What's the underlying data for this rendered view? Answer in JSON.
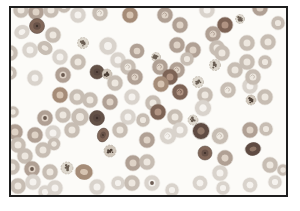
{
  "figure": {
    "kind": "peripheral-blood-smear-micrograph",
    "page_background": "#ffffff",
    "field_background": "#fcfbf8",
    "frame": {
      "x": 10,
      "y": 7,
      "width": 277,
      "height": 189,
      "border_color": "#1e1e1e",
      "border_width": 2
    }
  },
  "palette": {
    "shades": {
      "pale": {
        "ring": "#d9d3cc",
        "center": "#f5f2ee"
      },
      "light": {
        "ring": "#c7bdb3",
        "center": "#ede7df"
      },
      "med": {
        "ring": "#b0a094",
        "center": "#ded2c6"
      },
      "tan": {
        "ring": "#a58c78",
        "center": "#d6c3b1"
      },
      "dark": {
        "ring": "#7d6355",
        "center": "#b09382"
      },
      "vdark": {
        "ring": "#5e4c43",
        "center": "#907767"
      }
    },
    "platelet": {
      "base": "#ddd7cd",
      "dot": "#6b5e53",
      "dark_base": "#cfc5b9",
      "dark_dot": "#4e4037",
      "edge": "#aca296"
    },
    "core": "#4f3f37",
    "core_dot": "#3d302a"
  },
  "cells": [
    {
      "x": 21,
      "y": 10,
      "r": 8,
      "s": "light"
    },
    {
      "x": 36,
      "y": 12,
      "r": 8,
      "s": "med"
    },
    {
      "x": 51,
      "y": 10,
      "r": 8,
      "s": "light"
    },
    {
      "x": 64,
      "y": 6,
      "r": 7,
      "s": "light"
    },
    {
      "x": 78,
      "y": 15,
      "r": 8,
      "s": "pale"
    },
    {
      "x": 100,
      "y": 13,
      "r": 8,
      "s": "light",
      "m": 1
    },
    {
      "x": 130,
      "y": 15,
      "r": 8,
      "s": "tan"
    },
    {
      "x": 165,
      "y": 15,
      "r": 8,
      "s": "med",
      "m": 1
    },
    {
      "x": 180,
      "y": 25,
      "r": 8,
      "s": "med"
    },
    {
      "x": 207,
      "y": 10,
      "r": 8,
      "s": "pale"
    },
    {
      "x": 225,
      "y": 25,
      "r": 8,
      "s": "dark"
    },
    {
      "x": 240,
      "y": 19,
      "r": 4.5,
      "t": "plt"
    },
    {
      "x": 260,
      "y": 8,
      "r": 8,
      "s": "med"
    },
    {
      "x": 278,
      "y": 23,
      "r": 7,
      "s": "light"
    },
    {
      "x": 37,
      "y": 26,
      "r": 7.5,
      "t": "sphero",
      "s": "dark"
    },
    {
      "x": 22,
      "y": 32,
      "r": 8,
      "ry": 6.8,
      "rot": -25,
      "s": "pale"
    },
    {
      "x": 53,
      "y": 35,
      "r": 8,
      "s": "light"
    },
    {
      "x": 83,
      "y": 43,
      "r": 5.5,
      "t": "plt"
    },
    {
      "x": 108,
      "y": 46,
      "r": 9,
      "s": "pale"
    },
    {
      "x": 137,
      "y": 51,
      "r": 7.5,
      "s": "med"
    },
    {
      "x": 177,
      "y": 45,
      "r": 8,
      "s": "med"
    },
    {
      "x": 213,
      "y": 34,
      "r": 8,
      "s": "med",
      "m": 1
    },
    {
      "x": 217,
      "y": 48,
      "r": 8,
      "s": "light"
    },
    {
      "x": 247,
      "y": 43,
      "r": 8,
      "s": "light"
    },
    {
      "x": 268,
      "y": 42,
      "r": 8,
      "s": "light"
    },
    {
      "x": 193,
      "y": 50,
      "r": 8,
      "s": "med"
    },
    {
      "x": 10,
      "y": 53,
      "r": 8,
      "s": "light"
    },
    {
      "x": 30,
      "y": 50,
      "r": 8,
      "s": "pale"
    },
    {
      "x": 45,
      "y": 48,
      "r": 8,
      "ry": 6.5,
      "rot": 30,
      "s": "light"
    },
    {
      "x": 60,
      "y": 57,
      "r": 8,
      "s": "pale"
    },
    {
      "x": 78,
      "y": 62,
      "r": 8,
      "s": "light"
    },
    {
      "x": 118,
      "y": 60,
      "r": 8,
      "s": "pale"
    },
    {
      "x": 156,
      "y": 57,
      "r": 4.5,
      "t": "plt"
    },
    {
      "x": 160,
      "y": 67,
      "r": 8,
      "s": "med",
      "m": 1
    },
    {
      "x": 177,
      "y": 70,
      "r": 8,
      "s": "med",
      "m": 1
    },
    {
      "x": 187,
      "y": 59,
      "r": 7,
      "s": "light"
    },
    {
      "x": 222,
      "y": 53,
      "r": 8,
      "s": "light"
    },
    {
      "x": 247,
      "y": 62,
      "r": 8,
      "s": "light"
    },
    {
      "x": 265,
      "y": 62,
      "r": 7,
      "s": "light"
    },
    {
      "x": 215,
      "y": 65,
      "r": 5.5,
      "t": "plt"
    },
    {
      "x": 235,
      "y": 70,
      "r": 8,
      "s": "light"
    },
    {
      "x": 63,
      "y": 75,
      "r": 8,
      "s": "med",
      "dot": 1
    },
    {
      "x": 97,
      "y": 72,
      "r": 7,
      "t": "sphero",
      "s": "vdark"
    },
    {
      "x": 107,
      "y": 74,
      "r": 5,
      "t": "plt",
      "s": "dark"
    },
    {
      "x": 10,
      "y": 73,
      "r": 7,
      "s": "light"
    },
    {
      "x": 35,
      "y": 78,
      "r": 8,
      "s": "pale"
    },
    {
      "x": 128,
      "y": 67,
      "r": 8,
      "s": "light",
      "m": 1
    },
    {
      "x": 135,
      "y": 77,
      "r": 8,
      "s": "med",
      "m": 1
    },
    {
      "x": 115,
      "y": 83,
      "r": 8,
      "s": "light"
    },
    {
      "x": 170,
      "y": 77,
      "r": 8,
      "s": "dark"
    },
    {
      "x": 161,
      "y": 84,
      "r": 8,
      "s": "tan"
    },
    {
      "x": 180,
      "y": 92,
      "r": 8,
      "s": "dark",
      "m": 1
    },
    {
      "x": 198,
      "y": 82,
      "r": 5.5,
      "t": "plt"
    },
    {
      "x": 205,
      "y": 95,
      "r": 8,
      "s": "light"
    },
    {
      "x": 228,
      "y": 90,
      "r": 8,
      "s": "light",
      "m": 1
    },
    {
      "x": 250,
      "y": 86,
      "r": 8,
      "s": "pale"
    },
    {
      "x": 253,
      "y": 77,
      "r": 8,
      "s": "light",
      "m": 1
    },
    {
      "x": 265,
      "y": 97,
      "r": 8,
      "s": "light"
    },
    {
      "x": 251,
      "y": 100,
      "r": 5,
      "t": "plt",
      "s": "dark"
    },
    {
      "x": 60,
      "y": 95,
      "r": 8,
      "s": "tan"
    },
    {
      "x": 77,
      "y": 97,
      "r": 8,
      "s": "light"
    },
    {
      "x": 90,
      "y": 100,
      "r": 8,
      "s": "light"
    },
    {
      "x": 132,
      "y": 97,
      "r": 8,
      "s": "pale"
    },
    {
      "x": 110,
      "y": 102,
      "r": 8,
      "s": "med"
    },
    {
      "x": 153,
      "y": 103,
      "r": 8,
      "s": "light"
    },
    {
      "x": 203,
      "y": 108,
      "r": 8.5,
      "s": "pale"
    },
    {
      "x": 13,
      "y": 112,
      "r": 6,
      "s": "light"
    },
    {
      "x": 45,
      "y": 118,
      "r": 8,
      "s": "med",
      "dot": 1
    },
    {
      "x": 63,
      "y": 115,
      "r": 8,
      "s": "light"
    },
    {
      "x": 80,
      "y": 117,
      "r": 9,
      "s": "light"
    },
    {
      "x": 97,
      "y": 118,
      "r": 7.5,
      "t": "sphero",
      "s": "vdark"
    },
    {
      "x": 128,
      "y": 117,
      "r": 8,
      "s": "pale"
    },
    {
      "x": 143,
      "y": 120,
      "r": 7,
      "s": "light"
    },
    {
      "x": 158,
      "y": 112,
      "r": 8,
      "s": "dark"
    },
    {
      "x": 175,
      "y": 117,
      "r": 8,
      "s": "light"
    },
    {
      "x": 193,
      "y": 120,
      "r": 5,
      "t": "plt"
    },
    {
      "x": 180,
      "y": 130,
      "r": 8,
      "s": "pale"
    },
    {
      "x": 201,
      "y": 131,
      "r": 8.5,
      "s": "vdark"
    },
    {
      "x": 220,
      "y": 136,
      "r": 8.5,
      "s": "light",
      "m": 1
    },
    {
      "x": 250,
      "y": 130,
      "r": 8,
      "s": "med"
    },
    {
      "x": 266,
      "y": 129,
      "r": 7,
      "s": "light"
    },
    {
      "x": 15,
      "y": 132,
      "r": 8,
      "s": "med"
    },
    {
      "x": 35,
      "y": 135,
      "r": 8,
      "s": "med"
    },
    {
      "x": 53,
      "y": 133,
      "r": 8,
      "s": "pale"
    },
    {
      "x": 72,
      "y": 130,
      "r": 8,
      "s": "light"
    },
    {
      "x": 103,
      "y": 135,
      "r": 5.5,
      "ry": 7,
      "rot": 18,
      "t": "sphero",
      "s": "dark"
    },
    {
      "x": 120,
      "y": 130,
      "r": 8,
      "s": "light"
    },
    {
      "x": 147,
      "y": 140,
      "r": 8,
      "s": "med"
    },
    {
      "x": 168,
      "y": 136,
      "r": 8.5,
      "s": "pale",
      "m": 1
    },
    {
      "x": 18,
      "y": 145,
      "r": 8,
      "s": "light"
    },
    {
      "x": 25,
      "y": 156,
      "r": 8,
      "s": "light"
    },
    {
      "x": 43,
      "y": 150,
      "r": 8,
      "s": "light"
    },
    {
      "x": 54,
      "y": 144,
      "r": 6.5,
      "s": "light"
    },
    {
      "x": 110,
      "y": 151,
      "r": 6,
      "t": "plt",
      "s": "dark"
    },
    {
      "x": 133,
      "y": 163,
      "r": 8,
      "s": "med"
    },
    {
      "x": 147,
      "y": 162,
      "r": 8,
      "s": "light"
    },
    {
      "x": 205,
      "y": 153,
      "r": 7,
      "t": "sphero",
      "s": "dark"
    },
    {
      "x": 225,
      "y": 158,
      "r": 8,
      "t": "echino",
      "s": "med"
    },
    {
      "x": 253,
      "y": 149,
      "r": 8,
      "ry": 6.5,
      "rot": -10,
      "s": "vdark"
    },
    {
      "x": 270,
      "y": 165,
      "r": 8,
      "s": "light"
    },
    {
      "x": 283,
      "y": 170,
      "r": 6,
      "s": "light"
    },
    {
      "x": 12,
      "y": 167,
      "r": 8,
      "s": "light"
    },
    {
      "x": 32,
      "y": 169,
      "r": 8,
      "s": "med",
      "dot": 1
    },
    {
      "x": 50,
      "y": 172,
      "r": 8,
      "s": "light"
    },
    {
      "x": 67,
      "y": 168,
      "r": 6,
      "t": "plt"
    },
    {
      "x": 84,
      "y": 172,
      "r": 9,
      "ry": 7.5,
      "rot": 10,
      "s": "tan"
    },
    {
      "x": 33,
      "y": 182,
      "r": 8,
      "s": "pale"
    },
    {
      "x": 18,
      "y": 186,
      "r": 8,
      "s": "light"
    },
    {
      "x": 45,
      "y": 192,
      "r": 7,
      "s": "pale"
    },
    {
      "x": 55,
      "y": 188,
      "r": 8,
      "s": "pale"
    },
    {
      "x": 97,
      "y": 187,
      "r": 8,
      "s": "pale"
    },
    {
      "x": 118,
      "y": 183,
      "r": 7,
      "s": "pale"
    },
    {
      "x": 132,
      "y": 183,
      "r": 8,
      "s": "light"
    },
    {
      "x": 152,
      "y": 183,
      "r": 8,
      "s": "pale",
      "dot": 1
    },
    {
      "x": 172,
      "y": 190,
      "r": 7,
      "s": "pale"
    },
    {
      "x": 200,
      "y": 183,
      "r": 7.5,
      "t": "echino",
      "s": "pale"
    },
    {
      "x": 220,
      "y": 173,
      "r": 8,
      "s": "pale"
    },
    {
      "x": 223,
      "y": 188,
      "r": 7,
      "s": "pale"
    },
    {
      "x": 250,
      "y": 185,
      "r": 7.5,
      "t": "echino",
      "s": "pale"
    },
    {
      "x": 275,
      "y": 182,
      "r": 7,
      "s": "pale"
    }
  ]
}
